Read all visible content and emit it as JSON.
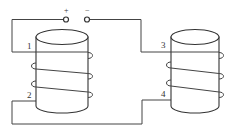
{
  "diagram": {
    "type": "electromagnet coils circuit",
    "power_source": {
      "positive_label": "+",
      "negative_label": "−"
    },
    "coils": [
      {
        "name": "left-coil",
        "terminals": [
          "1",
          "2"
        ]
      },
      {
        "name": "right-coil",
        "terminals": [
          "3",
          "4"
        ]
      }
    ],
    "labels": {
      "t1": "1",
      "t2": "2",
      "t3": "3",
      "t4": "4"
    },
    "colors": {
      "line": "#444444",
      "background": "#ffffff"
    }
  }
}
